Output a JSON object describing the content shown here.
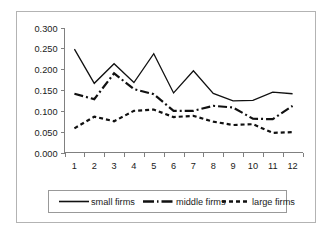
{
  "chart_data": {
    "type": "line",
    "title": "",
    "subtitle": "",
    "xlabel": "",
    "ylabel": "",
    "categories": [
      "1",
      "2",
      "3",
      "4",
      "5",
      "6",
      "7",
      "8",
      "9",
      "10",
      "11",
      "12"
    ],
    "ylim": [
      0.0,
      0.3
    ],
    "ytick_step": 0.05,
    "ytick_labels": [
      "0.000",
      "0.050",
      "0.100",
      "0.150",
      "0.200",
      "0.250",
      "0.300"
    ],
    "ytick_values": [
      0.0,
      0.05,
      0.1,
      0.15,
      0.2,
      0.25,
      0.3
    ],
    "grid": false,
    "legend_position": "bottom",
    "line_color": "#111111",
    "axis_color": "#808080",
    "series": [
      {
        "name": "small firms",
        "style": "solid",
        "values": [
          0.248,
          0.166,
          0.213,
          0.168,
          0.237,
          0.143,
          0.196,
          0.142,
          0.124,
          0.125,
          0.145,
          0.141
        ]
      },
      {
        "name": "middle firms",
        "style": "dash-dot",
        "values": [
          0.141,
          0.128,
          0.19,
          0.152,
          0.14,
          0.1,
          0.1,
          0.112,
          0.108,
          0.081,
          0.08,
          0.112
        ]
      },
      {
        "name": "large firms",
        "style": "dashed",
        "values": [
          0.058,
          0.086,
          0.075,
          0.1,
          0.103,
          0.085,
          0.088,
          0.074,
          0.066,
          0.068,
          0.047,
          0.049
        ]
      }
    ]
  },
  "legend": {
    "entries": [
      {
        "label": "small firms"
      },
      {
        "label": "middle firms"
      },
      {
        "label": "large firms"
      }
    ]
  }
}
